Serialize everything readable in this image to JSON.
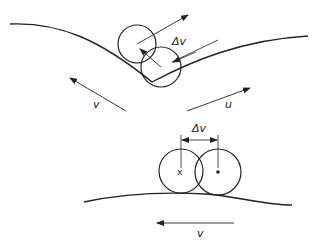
{
  "diagram": {
    "top_panel": {
      "labels": {
        "delta_v": "Δv",
        "v": "v",
        "u": "u"
      },
      "elements": [
        "curved surface (valley)",
        "circle at earlier position",
        "circle at later position",
        "velocity arrow v",
        "velocity arrow u",
        "normal arrow",
        "Δv dimension"
      ]
    },
    "bottom_panel": {
      "labels": {
        "delta_v": "Δv",
        "v": "v",
        "x_marker": "x"
      },
      "elements": [
        "convex surface",
        "circle with x centre",
        "circle with dot centre",
        "Δv dimension",
        "velocity arrow v (leftward)"
      ]
    },
    "stroke_color": "#222222"
  }
}
